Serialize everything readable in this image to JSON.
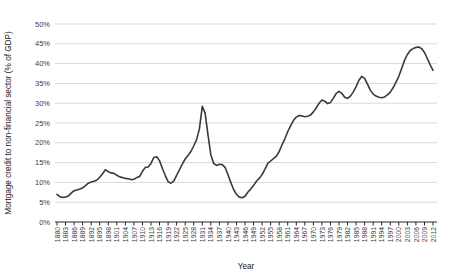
{
  "chart": {
    "ylabel": "Mortgage credit to non-financial sector (% of GDP)",
    "xlabel": "Year"
  },
  "chart_data": {
    "type": "line",
    "title": "",
    "xlabel": "Year",
    "ylabel": "Mortgage credit to non-financial sector (% of GDP)",
    "ylim": [
      0,
      50
    ],
    "ytick_step": 5,
    "ytick_suffix": "%",
    "xtick_start": 1880,
    "xtick_step": 3,
    "grid": "horizontal",
    "legend": "none",
    "line_color": "#3a3a3a",
    "grid_color": "#d9d9d9",
    "axis_color": "#404040",
    "tick_label_color": "#404040",
    "x": [
      1880,
      1881,
      1882,
      1883,
      1884,
      1885,
      1886,
      1887,
      1888,
      1889,
      1890,
      1891,
      1892,
      1893,
      1894,
      1895,
      1896,
      1897,
      1898,
      1899,
      1900,
      1901,
      1902,
      1903,
      1904,
      1905,
      1906,
      1907,
      1908,
      1909,
      1910,
      1911,
      1912,
      1913,
      1914,
      1915,
      1916,
      1917,
      1918,
      1919,
      1920,
      1921,
      1922,
      1923,
      1924,
      1925,
      1926,
      1927,
      1928,
      1929,
      1930,
      1931,
      1932,
      1933,
      1934,
      1935,
      1936,
      1937,
      1938,
      1939,
      1940,
      1941,
      1942,
      1943,
      1944,
      1945,
      1946,
      1947,
      1948,
      1949,
      1950,
      1951,
      1952,
      1953,
      1954,
      1955,
      1956,
      1957,
      1958,
      1959,
      1960,
      1961,
      1962,
      1963,
      1964,
      1965,
      1966,
      1967,
      1968,
      1969,
      1970,
      1971,
      1972,
      1973,
      1974,
      1975,
      1976,
      1977,
      1978,
      1979,
      1980,
      1981,
      1982,
      1983,
      1984,
      1985,
      1986,
      1987,
      1988,
      1989,
      1990,
      1991,
      1992,
      1993,
      1994,
      1995,
      1996,
      1997,
      1998,
      1999,
      2000,
      2001,
      2002,
      2003,
      2004,
      2005,
      2006,
      2007,
      2008,
      2009,
      2010,
      2011,
      2012
    ],
    "values": [
      7.0,
      6.4,
      6.2,
      6.3,
      6.6,
      7.3,
      7.9,
      8.1,
      8.3,
      8.6,
      9.2,
      9.8,
      10.1,
      10.3,
      10.6,
      11.3,
      12.2,
      13.2,
      12.7,
      12.4,
      12.3,
      11.8,
      11.4,
      11.2,
      11.0,
      10.9,
      10.7,
      10.8,
      11.2,
      11.5,
      12.8,
      13.8,
      13.9,
      14.8,
      16.3,
      16.5,
      15.5,
      13.5,
      11.8,
      10.2,
      9.8,
      10.3,
      11.8,
      13.2,
      14.6,
      15.9,
      16.8,
      17.8,
      19.2,
      20.8,
      23.5,
      29.2,
      27.5,
      22.0,
      17.0,
      14.8,
      14.3,
      14.6,
      14.5,
      13.8,
      12.0,
      10.0,
      8.2,
      7.0,
      6.3,
      6.1,
      6.5,
      7.5,
      8.3,
      9.2,
      10.3,
      11.0,
      12.0,
      13.3,
      14.8,
      15.4,
      16.0,
      16.6,
      17.8,
      19.5,
      21.0,
      22.8,
      24.3,
      25.6,
      26.5,
      26.9,
      26.8,
      26.6,
      26.7,
      27.0,
      27.8,
      28.8,
      30.0,
      30.8,
      30.5,
      29.9,
      30.2,
      31.2,
      32.5,
      33.0,
      32.5,
      31.5,
      31.2,
      31.8,
      32.8,
      34.2,
      35.8,
      36.8,
      36.3,
      34.8,
      33.3,
      32.3,
      31.8,
      31.5,
      31.4,
      31.6,
      32.1,
      32.8,
      33.9,
      35.3,
      36.8,
      38.8,
      40.8,
      42.3,
      43.3,
      43.8,
      44.1,
      44.2,
      43.8,
      42.8,
      41.3,
      39.7,
      38.3
    ]
  }
}
